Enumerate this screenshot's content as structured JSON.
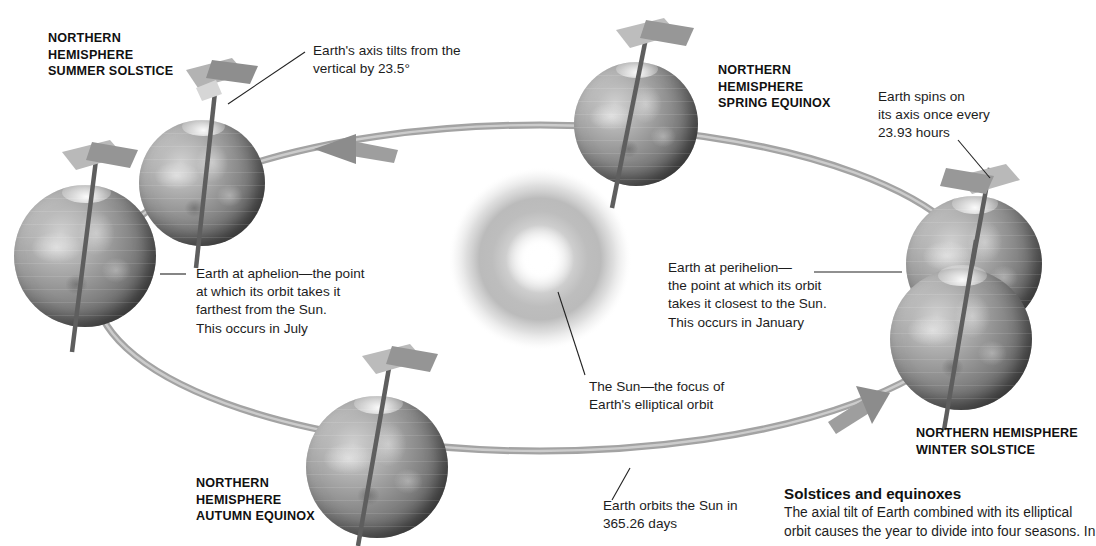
{
  "diagram": {
    "sun_color": "#f2f0ea",
    "orbit_color": "#9a9a9a",
    "globe_color": "#808080"
  },
  "positions": [
    {
      "id": "summer-solstice",
      "label": "NORTHERN\nHEMISPHERE\nSUMMER SOLSTICE"
    },
    {
      "id": "spring-equinox",
      "label": "NORTHERN\nHEMISPHERE\nSPRING EQUINOX"
    },
    {
      "id": "winter-solstice",
      "label": "NORTHERN HEMISPHERE\nWINTER SOLSTICE"
    },
    {
      "id": "autumn-equinox",
      "label": "NORTHERN\nHEMISPHERE\nAUTUMN EQUINOX"
    }
  ],
  "annotations": {
    "axial_tilt": "Earth's axis tilts from the\nvertical by 23.5°",
    "spin_rate": "Earth spins on\nits axis once every\n23.93 hours",
    "aphelion": "Earth at aphelion—the point\nat which its orbit takes it\nfarthest from the Sun.\nThis occurs in July",
    "perihelion": "Earth at perihelion—\nthe point at which its orbit\ntakes it closest to the Sun.\nThis occurs in January",
    "sun": "The Sun—the focus of\nEarth's elliptical orbit",
    "orbital_period": "Earth orbits the Sun in\n365.26 days"
  },
  "caption": {
    "title": "Solstices and equinoxes",
    "body": "The axial tilt of Earth combined with its elliptical\norbit causes the year to divide into four seasons. In"
  }
}
